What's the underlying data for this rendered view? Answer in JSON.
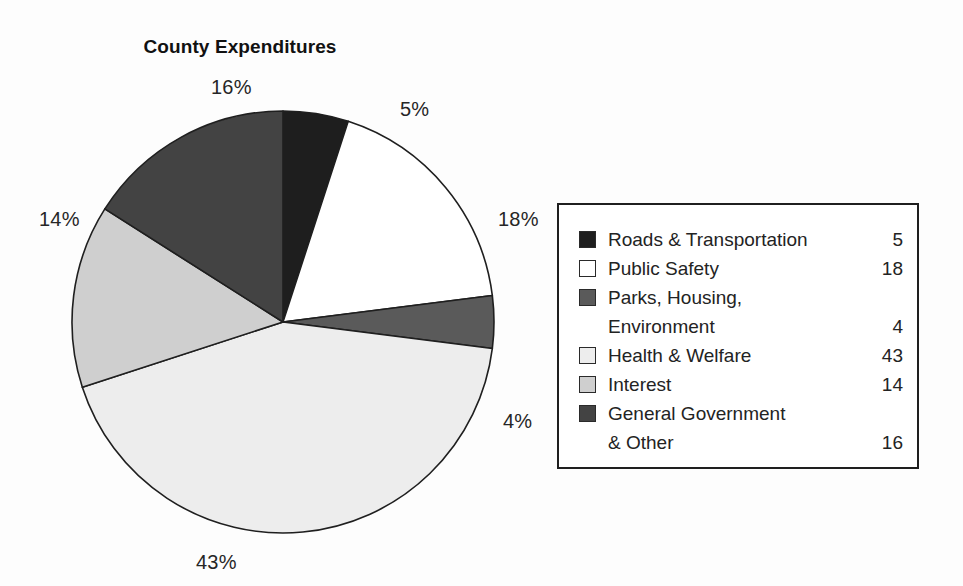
{
  "chart_data": {
    "type": "pie",
    "title": "County Expenditures",
    "categories": [
      "Roads & Transportation",
      "Public Safety",
      "Parks, Housing, Environment",
      "Health & Welfare",
      "Interest",
      "General Government & Other"
    ],
    "values": [
      5,
      18,
      4,
      43,
      14,
      16
    ],
    "value_labels": [
      "5",
      "18",
      "4",
      "43",
      "14",
      "16"
    ],
    "slice_labels": [
      "5%",
      "18%",
      "4%",
      "43%",
      "14%",
      "16%"
    ],
    "units": "percent",
    "total": 100,
    "start_angle_deg": 0,
    "direction": "clockwise",
    "legend_position": "right",
    "grid": false,
    "xlabel": "",
    "ylabel": "",
    "colors": [
      "#1e1e1e",
      "#ffffff",
      "#5a5a5a",
      "#ededed",
      "#cfcfcf",
      "#434343"
    ],
    "slice_outline_color": "#1f1f1f"
  },
  "title": "County Expenditures",
  "labels": {
    "roads_pct": "5%",
    "public_safety_pct": "18%",
    "parks_pct": "4%",
    "health_pct": "43%",
    "interest_pct": "14%",
    "general_pct": "16%"
  },
  "legend": {
    "rows": [
      {
        "label": "Roads & Transportation",
        "value": "5",
        "swatch": "#1e1e1e",
        "swatch_name": "legend-swatch-roads"
      },
      {
        "label": "Public Safety",
        "value": "18",
        "swatch": "#ffffff",
        "swatch_name": "legend-swatch-public-safety"
      },
      {
        "label": "Parks, Housing,",
        "value": "",
        "swatch": "#5a5a5a",
        "swatch_name": "legend-swatch-parks"
      },
      {
        "label": "Environment",
        "value": "4",
        "swatch": "",
        "swatch_name": "legend-swatch-parks-cont"
      },
      {
        "label": "Health & Welfare",
        "value": "43",
        "swatch": "#ededed",
        "swatch_name": "legend-swatch-health"
      },
      {
        "label": "Interest",
        "value": "14",
        "swatch": "#cfcfcf",
        "swatch_name": "legend-swatch-interest"
      },
      {
        "label": "General Government",
        "value": "",
        "swatch": "#434343",
        "swatch_name": "legend-swatch-general-government"
      },
      {
        "label": "& Other",
        "value": "16",
        "swatch": "",
        "swatch_name": "legend-swatch-general-government-cont"
      }
    ]
  }
}
